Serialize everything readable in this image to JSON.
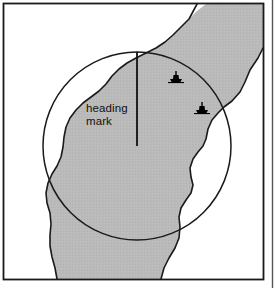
{
  "figure": {
    "name": "radar-ppi-chart-overlay",
    "background_color": "#ffffff",
    "frame": {
      "name": "figure-frame",
      "border_color": "#1a1a1a",
      "x": 3,
      "y": 3,
      "width": 261,
      "height": 277
    },
    "column_rule": {
      "name": "page-column-rule",
      "color": "#555555",
      "x": 272
    },
    "land_mass": {
      "name": "land-shading",
      "fill_color": "#b9b9b9",
      "outline_color": "#1a1a1a",
      "label": "land"
    },
    "water": {
      "name": "water-area",
      "fill_color": "#ffffff",
      "label": "water"
    },
    "range_circle": {
      "name": "radar-range-ring",
      "stroke_color": "#1a1a1a",
      "center_x": 137,
      "center_y": 146,
      "radius": 94
    },
    "heading_mark": {
      "name": "heading-mark-line",
      "stroke_color": "#111111",
      "label_line_1": "heading",
      "label_line_2": "mark",
      "label_x": 86,
      "label_line_1_y": 112,
      "label_line_2_y": 125,
      "x": 137,
      "y_top": 52,
      "y_bottom": 146
    },
    "targets": [
      {
        "name": "vessel-target-1",
        "label": "ship-icon",
        "x": 176,
        "y": 77,
        "color": "#000000"
      },
      {
        "name": "vessel-target-2",
        "label": "ship-icon",
        "x": 202,
        "y": 108,
        "color": "#000000"
      }
    ]
  }
}
